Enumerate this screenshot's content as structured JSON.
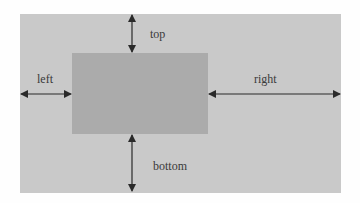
{
  "diagram": {
    "labels": {
      "top": "top",
      "left": "left",
      "right": "right",
      "bottom": "bottom"
    },
    "colors": {
      "background": "#fefefe",
      "outer_box": "#c9c9c9",
      "inner_box": "#ababab",
      "arrow": "#2a2a2a",
      "text": "#3a3a3a"
    }
  }
}
